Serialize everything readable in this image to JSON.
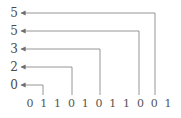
{
  "figure": {
    "type": "pointer-diagram",
    "background_color": "#ffffff",
    "line_color": "#8a8a8a",
    "text_color": "#4a4a4a",
    "width": 181,
    "height": 118
  },
  "labels": [
    {
      "id": "label-row-0",
      "text": "5",
      "x": 14,
      "y": 13,
      "arrow_tip_x": 21
    },
    {
      "id": "label-row-1",
      "text": "5",
      "x": 14,
      "y": 31,
      "arrow_tip_x": 21
    },
    {
      "id": "label-row-2",
      "text": "3",
      "x": 14,
      "y": 49,
      "arrow_tip_x": 21
    },
    {
      "id": "label-row-3",
      "text": "2",
      "x": 14,
      "y": 67,
      "arrow_tip_x": 21
    },
    {
      "id": "label-row-4",
      "text": "0",
      "x": 14,
      "y": 85,
      "arrow_tip_x": 21
    }
  ],
  "digits": {
    "sequence": [
      "0",
      "1",
      "1",
      "0",
      "1",
      "0",
      "1",
      "1",
      "0",
      "0",
      "1"
    ],
    "start_x": 30,
    "spacing": 13.8,
    "y": 104
  },
  "connectors": [
    {
      "id": "connector-0",
      "from_label_index": 0,
      "to_digit_index": 9,
      "corner_x": 155,
      "row_y": 13,
      "drop_to_y": 95
    },
    {
      "id": "connector-1",
      "from_label_index": 1,
      "to_digit_index": 8,
      "corner_x": 139,
      "row_y": 31,
      "drop_to_y": 95
    },
    {
      "id": "connector-2",
      "from_label_index": 2,
      "to_digit_index": 5,
      "corner_x": 100,
      "row_y": 49,
      "drop_to_y": 95
    },
    {
      "id": "connector-3",
      "from_label_index": 3,
      "to_digit_index": 3,
      "corner_x": 72,
      "row_y": 67,
      "drop_to_y": 95
    },
    {
      "id": "connector-4",
      "from_label_index": 4,
      "to_digit_index": 1,
      "corner_x": 43,
      "row_y": 85,
      "drop_to_y": 95
    }
  ],
  "chart_data": {
    "type": "diagram",
    "title": "",
    "categories": [
      "0",
      "1",
      "1",
      "0",
      "1",
      "0",
      "1",
      "1",
      "0",
      "0",
      "1"
    ],
    "labels": [
      "5",
      "5",
      "3",
      "2",
      "0"
    ],
    "pointer_targets": [
      9,
      8,
      5,
      3,
      1
    ],
    "pointer_values": [
      5,
      5,
      3,
      2,
      0
    ]
  }
}
